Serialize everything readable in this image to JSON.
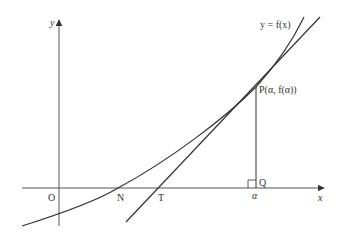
{
  "diagram": {
    "axes": {
      "x_label": "x",
      "y_label": "y",
      "origin_label": "O"
    },
    "curve_label": "y = f(x)",
    "points": {
      "P": "P(α, f(α))",
      "Q": "Q",
      "N": "N",
      "T": "T",
      "alpha": "α"
    },
    "colors": {
      "line": "#333333",
      "axis": "#555555"
    }
  }
}
